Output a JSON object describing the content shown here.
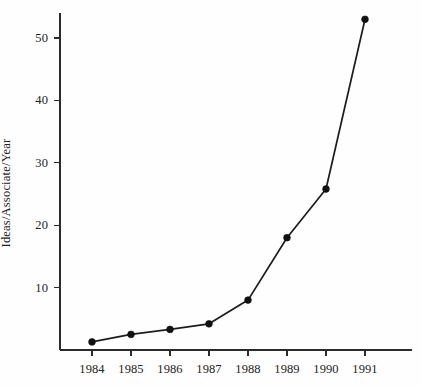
{
  "chart_data": {
    "type": "line",
    "title": "",
    "subtitle": "",
    "xlabel": "",
    "ylabel": "Ideas/Associate/Year",
    "categories": [
      "1984",
      "1985",
      "1986",
      "1987",
      "1988",
      "1989",
      "1990",
      "1991"
    ],
    "x": [
      1984,
      1985,
      1986,
      1987,
      1988,
      1989,
      1990,
      1991
    ],
    "values": [
      1.3,
      2.5,
      3.3,
      4.2,
      8.0,
      18.0,
      25.8,
      53.0
    ],
    "series": [
      {
        "name": "Ideas/Associate/Year",
        "values": [
          1.3,
          2.5,
          3.3,
          4.2,
          8.0,
          18.0,
          25.8,
          53.0
        ],
        "color": "#111111",
        "marker": "filled-circle"
      }
    ],
    "ylim": [
      0,
      54
    ],
    "xlim": [
      1983.2,
      1992.2
    ],
    "yticks": [
      10,
      20,
      30,
      40,
      50
    ],
    "ytick_labels": [
      "10",
      "20",
      "30",
      "40",
      "50"
    ],
    "xticks": [
      1984,
      1985,
      1986,
      1987,
      1988,
      1989,
      1990,
      1991
    ],
    "xtick_labels": [
      "1984",
      "1985",
      "1986",
      "1987",
      "1988",
      "1989",
      "1990",
      "1991"
    ],
    "grid": false,
    "legend": false,
    "legend_position": "none",
    "annotations": [],
    "axis_color": "#2b2b2b",
    "background_color": "#fefefe"
  },
  "axes": {
    "y_title": "Ideas/Associate/Year"
  }
}
